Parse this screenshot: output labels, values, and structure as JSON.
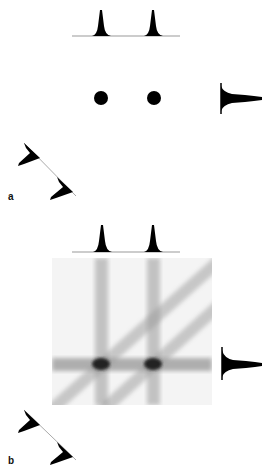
{
  "figure": {
    "panels": [
      {
        "id": "a",
        "label": "a",
        "description": "Two point sources with projection profiles",
        "points": [
          {
            "x": 101,
            "y": 98
          },
          {
            "x": 154,
            "y": 98
          }
        ],
        "projections": [
          "horizontal",
          "vertical",
          "diagonal"
        ]
      },
      {
        "id": "b",
        "label": "b",
        "description": "Backprojection image showing streaks from projections",
        "points": [
          {
            "x": 101,
            "y": 364
          },
          {
            "x": 153,
            "y": 364
          }
        ],
        "projections": [
          "horizontal",
          "vertical",
          "diagonal"
        ]
      }
    ]
  },
  "colors": {
    "background": "#ffffff",
    "profile": "#000000",
    "baseline": "#999999",
    "streak": "#8a8a8a"
  }
}
